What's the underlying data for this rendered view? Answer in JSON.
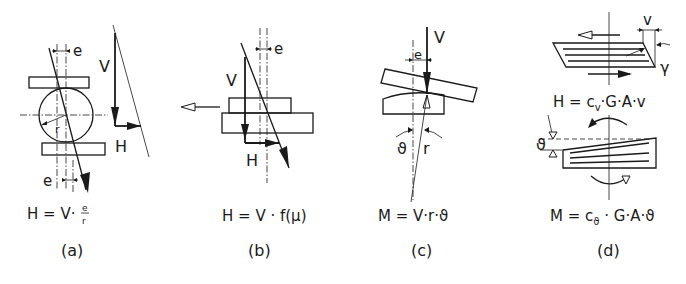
{
  "figure": {
    "panels": [
      {
        "id": "a",
        "caption": "(a)",
        "formula": {
          "lhs": "H = V·",
          "frac_num": "e",
          "frac_den": "r"
        },
        "labels": {
          "eccentricity_top": "e",
          "eccentricity_bottom": "e",
          "radius": "r",
          "vertical_force": "V",
          "horizontal_force": "H"
        },
        "description": "roller bearing with force triangle"
      },
      {
        "id": "b",
        "caption": "(b)",
        "formula": {
          "text": "H = V · f(μ)"
        },
        "labels": {
          "eccentricity": "e",
          "vertical_force": "V",
          "horizontal_force": "H"
        },
        "description": "sliding bearing"
      },
      {
        "id": "c",
        "caption": "(c)",
        "formula": {
          "text": "M = V·r·ϑ"
        },
        "labels": {
          "eccentricity": "e",
          "vertical_force": "V",
          "rotation": "ϑ",
          "radius": "r"
        },
        "description": "rocker bearing"
      },
      {
        "id": "d",
        "caption": "(d)",
        "formula_shear": {
          "text": "H = c",
          "sub": "v",
          "rest": "·G·A·v"
        },
        "formula_rotation": {
          "text": "M = c",
          "sub": "ϑ",
          "rest": " · G·A·ϑ"
        },
        "labels": {
          "displacement": "v",
          "shear_angle": "γ",
          "rotation": "ϑ"
        },
        "description": "elastomeric bearing under shear and rotation"
      }
    ]
  }
}
